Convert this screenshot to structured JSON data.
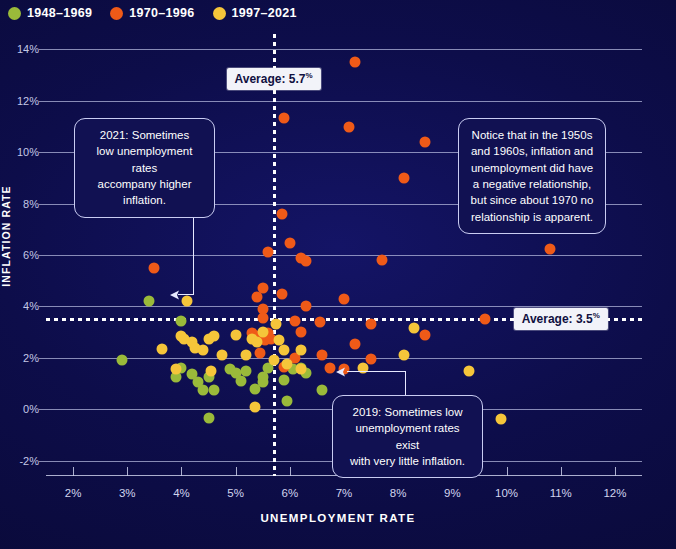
{
  "legend": {
    "items": [
      {
        "label": "1948–1969",
        "color": "#9aba3a",
        "icon": "circle-marker-icon"
      },
      {
        "label": "1970–1996",
        "color": "#ef5a18",
        "icon": "circle-marker-icon"
      },
      {
        "label": "1997–2021",
        "color": "#f5c53a",
        "icon": "circle-marker-icon"
      }
    ]
  },
  "axes": {
    "x_title": "UNEMPLOYMENT RATE",
    "y_title": "INFLATION RATE",
    "x_ticks": [
      "2%",
      "3%",
      "4%",
      "5%",
      "6%",
      "7%",
      "8%",
      "9%",
      "10%",
      "11%",
      "12%"
    ],
    "y_ticks": [
      "-2%",
      "0%",
      "2%",
      "4%",
      "6%",
      "8%",
      "10%",
      "12%",
      "14%"
    ]
  },
  "averages": {
    "unemployment": {
      "label_prefix": "Average: ",
      "value": "5.7",
      "suffix": "%",
      "x": 5.7
    },
    "inflation": {
      "label_prefix": "Average: ",
      "value": "3.5",
      "suffix": "%",
      "y": 3.5
    }
  },
  "annotations": [
    {
      "id": "anno-2021",
      "lines": [
        "2021: Sometimes",
        "low unemployment rates",
        "accompany higher inflation."
      ],
      "text": "2021: Sometimes low unemployment rates accompany higher inflation."
    },
    {
      "id": "anno-notice",
      "lines": [
        "Notice that in the 1950s",
        "and 1960s, inflation and",
        "unemployment did have",
        "a negative relationship,",
        "but since about 1970 no",
        "relationship is apparent."
      ],
      "text": "Notice that in the 1950s and 1960s, inflation and unemployment did have a negative relationship, but since about 1970 no relationship is apparent."
    },
    {
      "id": "anno-2019",
      "lines": [
        "2019: Sometimes low",
        "unemployment rates exist",
        "with very little inflation."
      ],
      "text": "2019: Sometimes low unemployment rates exist with very little inflation."
    }
  ],
  "colors": {
    "background": "#0b0b3f",
    "series_1948_1969": "#9aba3a",
    "series_1970_1996": "#ef5a18",
    "series_1997_2021": "#f5c53a",
    "grid": "#b9bde0",
    "average_line": "#ffffff",
    "annotation_border": "#c9ccf2"
  },
  "chart_data": {
    "type": "scatter",
    "title": "",
    "xlabel": "UNEMPLOYMENT RATE",
    "ylabel": "INFLATION RATE",
    "xlim": [
      1.5,
      12.5
    ],
    "ylim": [
      -2.6,
      14.6
    ],
    "grid": true,
    "legend_position": "top-left",
    "reference_lines": [
      {
        "orientation": "vertical",
        "value": 5.7,
        "label": "Average: 5.7%",
        "style": "dotted",
        "color": "#ffffff"
      },
      {
        "orientation": "horizontal",
        "value": 3.5,
        "label": "Average: 3.5%",
        "style": "dotted",
        "color": "#ffffff"
      }
    ],
    "series": [
      {
        "name": "1948–1969",
        "color": "#9aba3a",
        "points": [
          [
            3.8,
            8.1
          ],
          [
            3.4,
            4.2
          ],
          [
            2.9,
            1.9
          ],
          [
            4.0,
            1.6
          ],
          [
            4.2,
            1.35
          ],
          [
            4.3,
            1.05
          ],
          [
            4.5,
            1.25
          ],
          [
            4.4,
            0.75
          ],
          [
            4.6,
            0.75
          ],
          [
            4.5,
            -0.35
          ],
          [
            4.9,
            1.55
          ],
          [
            5.0,
            1.4
          ],
          [
            5.1,
            1.1
          ],
          [
            5.2,
            1.5
          ],
          [
            5.35,
            0.8
          ],
          [
            5.5,
            1.25
          ],
          [
            5.5,
            1.05
          ],
          [
            5.6,
            1.6
          ],
          [
            5.9,
            1.15
          ],
          [
            6.05,
            1.55
          ],
          [
            6.2,
            1.6
          ],
          [
            6.3,
            1.4
          ],
          [
            4.0,
            3.45
          ],
          [
            6.6,
            0.75
          ],
          [
            3.9,
            1.25
          ],
          [
            5.95,
            0.3
          ]
        ]
      },
      {
        "name": "1970–1996",
        "color": "#ef5a18",
        "points": [
          [
            7.2,
            13.5
          ],
          [
            5.9,
            11.35
          ],
          [
            7.1,
            11.0
          ],
          [
            8.5,
            10.4
          ],
          [
            8.1,
            9.0
          ],
          [
            5.85,
            7.6
          ],
          [
            5.6,
            6.1
          ],
          [
            10.8,
            6.25
          ],
          [
            7.7,
            5.8
          ],
          [
            6.0,
            6.45
          ],
          [
            6.2,
            5.9
          ],
          [
            6.3,
            5.75
          ],
          [
            3.5,
            5.5
          ],
          [
            5.85,
            4.5
          ],
          [
            5.5,
            4.7
          ],
          [
            5.4,
            4.35
          ],
          [
            7.0,
            4.3
          ],
          [
            6.3,
            4.0
          ],
          [
            5.5,
            3.9
          ],
          [
            5.5,
            3.55
          ],
          [
            6.1,
            3.45
          ],
          [
            6.55,
            3.4
          ],
          [
            7.5,
            3.3
          ],
          [
            6.2,
            3.0
          ],
          [
            8.5,
            2.9
          ],
          [
            5.6,
            2.95
          ],
          [
            5.4,
            2.85
          ],
          [
            5.55,
            2.7
          ],
          [
            5.65,
            2.75
          ],
          [
            5.3,
            2.95
          ],
          [
            7.2,
            2.55
          ],
          [
            9.6,
            3.5
          ],
          [
            6.6,
            2.1
          ],
          [
            7.5,
            1.95
          ],
          [
            5.45,
            2.2
          ],
          [
            6.1,
            2.0
          ],
          [
            5.9,
            1.65
          ],
          [
            6.75,
            1.6
          ],
          [
            7.0,
            1.55
          ]
        ]
      },
      {
        "name": "1997–2021",
        "color": "#f5c53a",
        "points": [
          [
            4.1,
            4.2
          ],
          [
            4.0,
            2.85
          ],
          [
            4.2,
            2.6
          ],
          [
            4.25,
            2.4
          ],
          [
            4.4,
            2.3
          ],
          [
            4.6,
            2.85
          ],
          [
            5.0,
            2.9
          ],
          [
            5.3,
            2.75
          ],
          [
            5.5,
            3.0
          ],
          [
            5.4,
            2.6
          ],
          [
            5.8,
            2.7
          ],
          [
            5.75,
            3.3
          ],
          [
            3.65,
            2.35
          ],
          [
            4.75,
            2.1
          ],
          [
            5.2,
            2.1
          ],
          [
            6.2,
            2.3
          ],
          [
            8.1,
            2.1
          ],
          [
            3.9,
            1.55
          ],
          [
            4.55,
            1.5
          ],
          [
            5.7,
            1.9
          ],
          [
            5.95,
            1.75
          ],
          [
            6.2,
            1.55
          ],
          [
            7.35,
            1.6
          ],
          [
            9.3,
            1.5
          ],
          [
            9.9,
            -0.4
          ],
          [
            5.35,
            0.1
          ],
          [
            5.9,
            2.3
          ],
          [
            8.3,
            3.15
          ],
          [
            4.05,
            2.75
          ],
          [
            4.5,
            2.75
          ]
        ]
      }
    ]
  }
}
